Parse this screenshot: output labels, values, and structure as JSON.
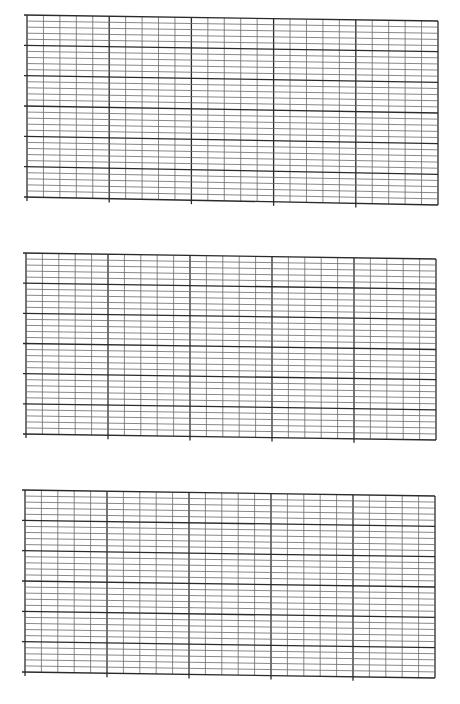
{
  "page": {
    "title": "",
    "background": "#ffffff"
  },
  "grid_style": {
    "major_color": "#2a2a2a",
    "minor_color": "#6a6a6a",
    "major_width": 1.3,
    "minor_width": 0.8,
    "minor_columns": 25,
    "minor_rows": 30,
    "major_every": 5,
    "tick_left": 3,
    "tick_bottom": 4
  },
  "grids": [
    {
      "name": "grid-1",
      "left": 27,
      "right": 438,
      "top_left": 15,
      "top_right": 21,
      "bottom_left": 197,
      "bottom_right": 205
    },
    {
      "name": "grid-2",
      "left": 26,
      "right": 436,
      "top_left": 253,
      "top_right": 259,
      "bottom_left": 434,
      "bottom_right": 440
    },
    {
      "name": "grid-3",
      "left": 25,
      "right": 435,
      "top_left": 490,
      "top_right": 496,
      "bottom_left": 672,
      "bottom_right": 678
    }
  ]
}
